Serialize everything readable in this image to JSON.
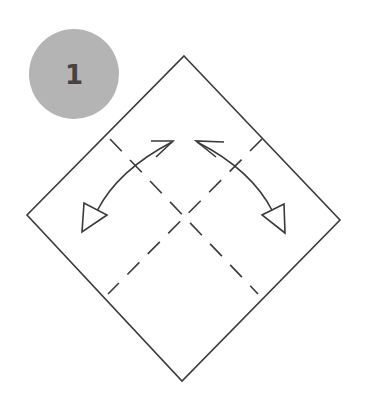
{
  "step": {
    "number": "1",
    "badge_color": "#b4b4b4",
    "number_color": "#444444"
  },
  "diagram": {
    "line_color": "#3a3a3a",
    "paper": {
      "top": [
        184,
        56
      ],
      "right": [
        340,
        220
      ],
      "bottom": [
        182,
        381
      ],
      "left": [
        27,
        215
      ]
    },
    "fold_lines": [
      {
        "type": "dashed",
        "from": [
          110,
          139
        ],
        "to": [
          258,
          294
        ]
      },
      {
        "type": "dashed",
        "from": [
          262,
          139
        ],
        "to": [
          108,
          294
        ]
      }
    ],
    "arrows": [
      {
        "name": "left-fold-arrow",
        "start_tip": [
          173,
          141
        ],
        "end_tip": [
          82,
          232
        ]
      },
      {
        "name": "right-fold-arrow",
        "start_tip": [
          196,
          141
        ],
        "end_tip": [
          285,
          233
        ]
      }
    ]
  }
}
